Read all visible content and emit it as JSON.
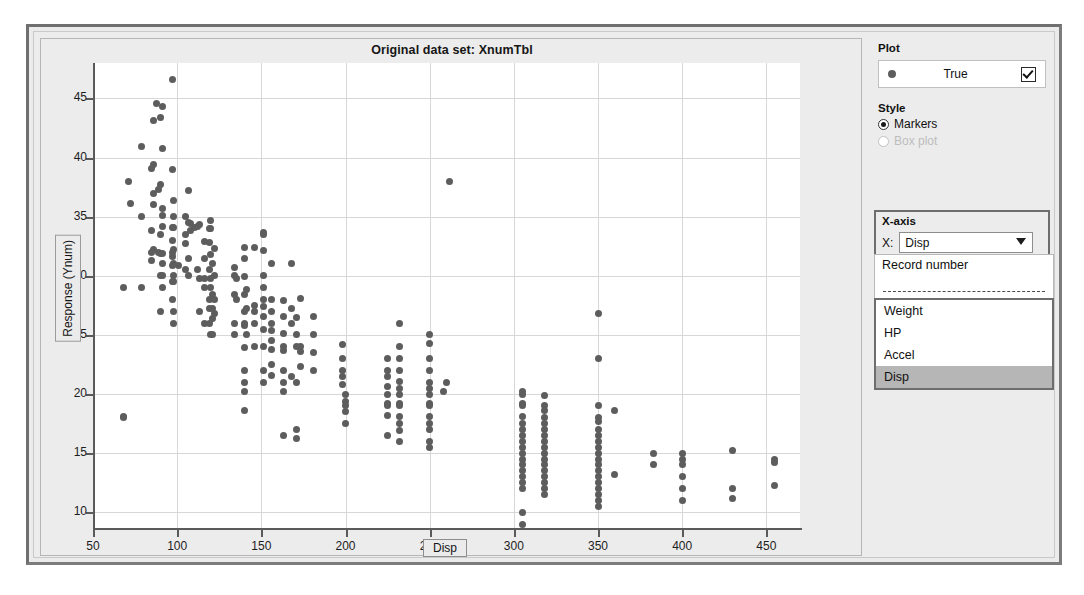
{
  "window": {
    "plot_title": "Original data set: XnumTbl"
  },
  "side_panel": {
    "plot_group_label": "Plot",
    "legend": {
      "label": "True",
      "checked": true,
      "marker": "dot-marker"
    },
    "style_group_label": "Style",
    "style_options": [
      {
        "label": "Markers",
        "selected": true,
        "disabled": false
      },
      {
        "label": "Box plot",
        "selected": false,
        "disabled": true
      }
    ],
    "xaxis_group_label": "X-axis",
    "x_field_label": "X:",
    "x_selected": "Disp",
    "dropdown": {
      "top_options": [
        "Record number"
      ],
      "separator": "dashed",
      "list_options": [
        "Weight",
        "HP",
        "Accel",
        "Disp"
      ],
      "highlighted": "Disp"
    }
  },
  "chart_data": {
    "type": "scatter",
    "title": "Original data set: XnumTbl",
    "xlabel": "Disp",
    "ylabel": "Response (Ynum)",
    "xlim": [
      50,
      470
    ],
    "ylim": [
      8.5,
      48
    ],
    "xticks": [
      50,
      100,
      150,
      200,
      250,
      300,
      350,
      400,
      450
    ],
    "yticks": [
      10,
      15,
      20,
      25,
      30,
      35,
      40,
      45
    ],
    "grid": true,
    "legend_position": "right-panel",
    "series": [
      {
        "name": "True",
        "marker": "filled-circle",
        "color": "#5d5d5d",
        "points": [
          [
            97,
            46.6
          ],
          [
            88,
            44.6
          ],
          [
            91,
            44.3
          ],
          [
            90,
            43.4
          ],
          [
            86,
            43.1
          ],
          [
            79,
            40.9
          ],
          [
            91,
            40.8
          ],
          [
            86,
            39.4
          ],
          [
            85,
            39.1
          ],
          [
            97,
            39.0
          ],
          [
            71,
            38.0
          ],
          [
            262,
            38.0
          ],
          [
            90,
            37.7
          ],
          [
            89,
            37.3
          ],
          [
            107,
            37.2
          ],
          [
            86,
            37.0
          ],
          [
            98,
            36.4
          ],
          [
            72,
            36.1
          ],
          [
            86,
            36.0
          ],
          [
            91,
            35.7
          ],
          [
            91,
            35.1
          ],
          [
            79,
            35.0
          ],
          [
            98,
            35.0
          ],
          [
            105,
            35.0
          ],
          [
            120,
            34.7
          ],
          [
            107,
            34.5
          ],
          [
            108,
            34.4
          ],
          [
            113,
            34.3
          ],
          [
            91,
            34.2
          ],
          [
            112,
            34.2
          ],
          [
            110,
            34.1
          ],
          [
            97,
            34.1
          ],
          [
            98,
            34.1
          ],
          [
            119,
            34.0
          ],
          [
            120,
            34.0
          ],
          [
            108,
            33.8
          ],
          [
            85,
            33.8
          ],
          [
            151,
            33.7
          ],
          [
            90,
            33.5
          ],
          [
            105,
            33.5
          ],
          [
            151,
            33.5
          ],
          [
            97,
            33.0
          ],
          [
            116,
            32.9
          ],
          [
            119,
            32.8
          ],
          [
            105,
            32.7
          ],
          [
            140,
            32.4
          ],
          [
            146,
            32.4
          ],
          [
            122,
            32.3
          ],
          [
            86,
            32.2
          ],
          [
            98,
            32.2
          ],
          [
            151,
            32.1
          ],
          [
            97,
            32.0
          ],
          [
            89,
            32.0
          ],
          [
            85,
            32.0
          ],
          [
            90,
            31.9
          ],
          [
            91,
            31.9
          ],
          [
            120,
            31.8
          ],
          [
            97,
            31.6
          ],
          [
            107,
            31.5
          ],
          [
            116,
            31.5
          ],
          [
            140,
            31.5
          ],
          [
            85,
            31.3
          ],
          [
            121,
            31.0
          ],
          [
            98,
            31.0
          ],
          [
            91,
            31.0
          ],
          [
            156,
            31.0
          ],
          [
            168,
            31.0
          ],
          [
            97,
            30.9
          ],
          [
            101,
            30.9
          ],
          [
            134,
            30.7
          ],
          [
            112,
            30.5
          ],
          [
            119,
            30.5
          ],
          [
            105,
            30.5
          ],
          [
            134,
            30.0
          ],
          [
            98,
            30.0
          ],
          [
            90,
            30.0
          ],
          [
            151,
            30.0
          ],
          [
            107,
            30.0
          ],
          [
            91,
            30.0
          ],
          [
            122,
            30.0
          ],
          [
            140,
            29.9
          ],
          [
            135,
            29.8
          ],
          [
            113,
            29.8
          ],
          [
            116,
            29.8
          ],
          [
            120,
            29.8
          ],
          [
            98,
            29.5
          ],
          [
            97,
            29.5
          ],
          [
            68,
            29.0
          ],
          [
            79,
            29.0
          ],
          [
            91,
            29.0
          ],
          [
            116,
            29.0
          ],
          [
            120,
            29.0
          ],
          [
            151,
            29.0
          ],
          [
            141,
            28.8
          ],
          [
            121,
            28.4
          ],
          [
            134,
            28.4
          ],
          [
            140,
            28.4
          ],
          [
            173,
            28.1
          ],
          [
            151,
            28.0
          ],
          [
            156,
            28.0
          ],
          [
            119,
            28.0
          ],
          [
            122,
            28.0
          ],
          [
            135,
            28.0
          ],
          [
            97,
            28.0
          ],
          [
            163,
            27.9
          ],
          [
            146,
            27.5
          ],
          [
            151,
            27.4
          ],
          [
            168,
            27.2
          ],
          [
            141,
            27.2
          ],
          [
            121,
            27.2
          ],
          [
            119,
            27.2
          ],
          [
            140,
            27.0
          ],
          [
            146,
            27.0
          ],
          [
            156,
            27.0
          ],
          [
            113,
            27.0
          ],
          [
            98,
            27.0
          ],
          [
            90,
            27.0
          ],
          [
            122,
            26.8
          ],
          [
            151,
            26.6
          ],
          [
            163,
            26.6
          ],
          [
            171,
            26.5
          ],
          [
            181,
            26.6
          ],
          [
            121,
            26.4
          ],
          [
            134,
            26.0
          ],
          [
            140,
            26.0
          ],
          [
            146,
            26.0
          ],
          [
            156,
            26.0
          ],
          [
            168,
            26.0
          ],
          [
            98,
            26.0
          ],
          [
            116,
            26.0
          ],
          [
            119,
            26.0
          ],
          [
            232,
            26.0
          ],
          [
            350,
            26.8
          ],
          [
            250,
            24.3
          ],
          [
            198,
            24.2
          ],
          [
            140,
            25.8
          ],
          [
            151,
            25.5
          ],
          [
            156,
            25.4
          ],
          [
            163,
            25.1
          ],
          [
            181,
            25.0
          ],
          [
            171,
            25.0
          ],
          [
            250,
            25.0
          ],
          [
            120,
            25.0
          ],
          [
            134,
            25.0
          ],
          [
            121,
            25.0
          ],
          [
            141,
            25.0
          ],
          [
            156,
            24.5
          ],
          [
            173,
            24.0
          ],
          [
            163,
            24.0
          ],
          [
            146,
            24.0
          ],
          [
            171,
            24.0
          ],
          [
            151,
            24.0
          ],
          [
            232,
            24.0
          ],
          [
            140,
            23.9
          ],
          [
            156,
            23.8
          ],
          [
            163,
            23.7
          ],
          [
            173,
            23.6
          ],
          [
            181,
            23.5
          ],
          [
            350,
            23.0
          ],
          [
            250,
            23.0
          ],
          [
            232,
            23.0
          ],
          [
            225,
            23.0
          ],
          [
            198,
            23.0
          ],
          [
            156,
            22.5
          ],
          [
            173,
            22.3
          ],
          [
            163,
            22.0
          ],
          [
            181,
            22.0
          ],
          [
            198,
            22.0
          ],
          [
            225,
            22.0
          ],
          [
            232,
            22.0
          ],
          [
            250,
            22.0
          ],
          [
            140,
            22.0
          ],
          [
            151,
            22.0
          ],
          [
            156,
            21.6
          ],
          [
            168,
            21.5
          ],
          [
            198,
            21.5
          ],
          [
            225,
            21.5
          ],
          [
            232,
            21.1
          ],
          [
            250,
            21.0
          ],
          [
            260,
            21.0
          ],
          [
            140,
            21.0
          ],
          [
            151,
            21.0
          ],
          [
            163,
            21.0
          ],
          [
            171,
            21.0
          ],
          [
            198,
            20.8
          ],
          [
            225,
            20.6
          ],
          [
            232,
            20.5
          ],
          [
            250,
            20.5
          ],
          [
            258,
            20.2
          ],
          [
            305,
            20.2
          ],
          [
            163,
            20.2
          ],
          [
            140,
            20.2
          ],
          [
            200,
            20.0
          ],
          [
            225,
            20.0
          ],
          [
            232,
            20.0
          ],
          [
            250,
            20.0
          ],
          [
            305,
            20.0
          ],
          [
            318,
            19.9
          ],
          [
            200,
            19.4
          ],
          [
            225,
            19.2
          ],
          [
            232,
            19.2
          ],
          [
            250,
            19.2
          ],
          [
            305,
            19.2
          ],
          [
            318,
            19.0
          ],
          [
            350,
            19.0
          ],
          [
            360,
            18.6
          ],
          [
            200,
            19.0
          ],
          [
            225,
            19.0
          ],
          [
            232,
            19.0
          ],
          [
            250,
            19.0
          ],
          [
            305,
            19.0
          ],
          [
            318,
            18.6
          ],
          [
            140,
            18.6
          ],
          [
            200,
            18.5
          ],
          [
            225,
            18.2
          ],
          [
            232,
            18.1
          ],
          [
            250,
            18.1
          ],
          [
            305,
            18.1
          ],
          [
            318,
            18.0
          ],
          [
            350,
            18.0
          ],
          [
            68,
            18.1
          ],
          [
            68,
            18.0
          ],
          [
            350,
            17.7
          ],
          [
            318,
            17.5
          ],
          [
            305,
            17.5
          ],
          [
            250,
            17.5
          ],
          [
            232,
            17.5
          ],
          [
            200,
            17.5
          ],
          [
            171,
            17.0
          ],
          [
            350,
            17.0
          ],
          [
            318,
            17.0
          ],
          [
            305,
            17.0
          ],
          [
            250,
            17.0
          ],
          [
            232,
            16.9
          ],
          [
            225,
            16.5
          ],
          [
            163,
            16.5
          ],
          [
            171,
            16.2
          ],
          [
            350,
            16.5
          ],
          [
            318,
            16.5
          ],
          [
            305,
            16.5
          ],
          [
            250,
            16.0
          ],
          [
            232,
            16.0
          ],
          [
            350,
            16.0
          ],
          [
            318,
            16.0
          ],
          [
            305,
            16.0
          ],
          [
            250,
            15.5
          ],
          [
            350,
            15.5
          ],
          [
            318,
            15.5
          ],
          [
            305,
            15.5
          ],
          [
            383,
            15.0
          ],
          [
            400,
            15.0
          ],
          [
            430,
            15.2
          ],
          [
            455,
            14.5
          ],
          [
            350,
            15.0
          ],
          [
            318,
            15.0
          ],
          [
            305,
            15.0
          ],
          [
            350,
            14.5
          ],
          [
            318,
            14.5
          ],
          [
            305,
            14.5
          ],
          [
            400,
            14.5
          ],
          [
            455,
            14.2
          ],
          [
            350,
            14.0
          ],
          [
            318,
            14.0
          ],
          [
            305,
            14.0
          ],
          [
            383,
            14.0
          ],
          [
            400,
            14.0
          ],
          [
            350,
            13.5
          ],
          [
            318,
            13.5
          ],
          [
            305,
            13.5
          ],
          [
            400,
            13.0
          ],
          [
            350,
            13.0
          ],
          [
            318,
            13.0
          ],
          [
            305,
            13.0
          ],
          [
            360,
            13.2
          ],
          [
            350,
            12.5
          ],
          [
            318,
            12.5
          ],
          [
            305,
            12.5
          ],
          [
            455,
            12.3
          ],
          [
            430,
            12.0
          ],
          [
            400,
            12.0
          ],
          [
            350,
            12.0
          ],
          [
            318,
            12.0
          ],
          [
            305,
            12.0
          ],
          [
            350,
            11.0
          ],
          [
            400,
            11.0
          ],
          [
            430,
            11.2
          ],
          [
            305,
            10.0
          ],
          [
            350,
            10.5
          ],
          [
            305,
            9.0
          ],
          [
            350,
            11.5
          ],
          [
            318,
            11.5
          ]
        ]
      }
    ]
  }
}
